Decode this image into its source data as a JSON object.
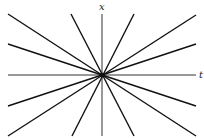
{
  "diagram": {
    "type": "fan-of-lines",
    "axes": {
      "horizontal_label": "t",
      "vertical_label": "x"
    },
    "origin": [
      102,
      75
    ],
    "axis_color": "#333333",
    "line_color": "#111111",
    "axes_lines": [
      {
        "name": "t-axis",
        "x1": 8,
        "y1": 75,
        "x2": 196,
        "y2": 75
      },
      {
        "name": "x-axis",
        "x1": 102,
        "y1": 14,
        "x2": 102,
        "y2": 136
      }
    ],
    "rays": [
      {
        "x1": 8,
        "y1": 14,
        "x2": 196,
        "y2": 136
      },
      {
        "x1": 8,
        "y1": 44,
        "x2": 196,
        "y2": 106
      },
      {
        "x1": 71,
        "y1": 14,
        "x2": 134,
        "y2": 136
      },
      {
        "x1": 134,
        "y1": 14,
        "x2": 72,
        "y2": 136
      },
      {
        "x1": 196,
        "y1": 15,
        "x2": 8,
        "y2": 136
      },
      {
        "x1": 196,
        "y1": 44,
        "x2": 8,
        "y2": 106
      }
    ]
  }
}
